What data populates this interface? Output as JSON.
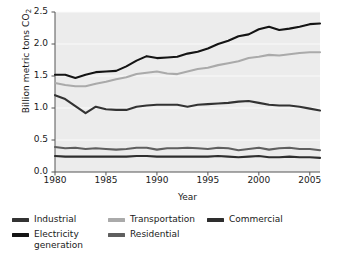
{
  "chart_data": {
    "type": "line",
    "title": "",
    "xlabel": "Year",
    "ylabel": "Billion metric tons CO",
    "ylabel_sub": "2",
    "xlim": [
      1980,
      2006
    ],
    "ylim": [
      0.0,
      2.5
    ],
    "xticks": [
      1980,
      1985,
      1990,
      1995,
      2000,
      2005
    ],
    "yticks": [
      "0.0",
      "0.5",
      "1.0",
      "1.5",
      "2.0",
      "2.5"
    ],
    "grid": "horizontal-faint",
    "legend_position": "below-plot",
    "plot_background": "#ececec",
    "x": [
      1980,
      1981,
      1982,
      1983,
      1984,
      1985,
      1986,
      1987,
      1988,
      1989,
      1990,
      1991,
      1992,
      1993,
      1994,
      1995,
      1996,
      1997,
      1998,
      1999,
      2000,
      2001,
      2002,
      2003,
      2004,
      2005,
      2006
    ],
    "series": [
      {
        "name": "Electricity generation",
        "color": "#141414",
        "values": [
          1.52,
          1.52,
          1.47,
          1.52,
          1.56,
          1.57,
          1.58,
          1.65,
          1.74,
          1.81,
          1.78,
          1.79,
          1.8,
          1.85,
          1.88,
          1.93,
          2.0,
          2.05,
          2.12,
          2.15,
          2.23,
          2.27,
          2.22,
          2.24,
          2.27,
          2.31,
          2.32
        ]
      },
      {
        "name": "Transportation",
        "color": "#aaaaaa",
        "values": [
          1.39,
          1.36,
          1.34,
          1.34,
          1.38,
          1.41,
          1.45,
          1.48,
          1.53,
          1.55,
          1.57,
          1.54,
          1.53,
          1.57,
          1.61,
          1.63,
          1.67,
          1.7,
          1.73,
          1.78,
          1.8,
          1.83,
          1.82,
          1.84,
          1.86,
          1.87,
          1.87
        ]
      },
      {
        "name": "Industrial",
        "color": "#333333",
        "values": [
          1.2,
          1.14,
          1.03,
          0.92,
          1.02,
          0.98,
          0.97,
          0.97,
          1.02,
          1.04,
          1.05,
          1.05,
          1.05,
          1.02,
          1.05,
          1.06,
          1.07,
          1.08,
          1.1,
          1.11,
          1.08,
          1.05,
          1.04,
          1.04,
          1.02,
          0.99,
          0.96
        ]
      },
      {
        "name": "Residential",
        "color": "#5f5f5f",
        "values": [
          0.39,
          0.37,
          0.38,
          0.36,
          0.37,
          0.36,
          0.35,
          0.36,
          0.38,
          0.38,
          0.35,
          0.37,
          0.37,
          0.38,
          0.37,
          0.36,
          0.38,
          0.37,
          0.34,
          0.36,
          0.38,
          0.35,
          0.37,
          0.38,
          0.36,
          0.36,
          0.34
        ]
      },
      {
        "name": "Commercial",
        "color": "#2e2e2e",
        "values": [
          0.25,
          0.24,
          0.24,
          0.24,
          0.24,
          0.24,
          0.24,
          0.24,
          0.25,
          0.25,
          0.24,
          0.24,
          0.24,
          0.24,
          0.24,
          0.24,
          0.25,
          0.24,
          0.23,
          0.24,
          0.25,
          0.23,
          0.23,
          0.24,
          0.23,
          0.23,
          0.22
        ]
      }
    ]
  },
  "legend": {
    "entries": [
      {
        "label": "Industrial",
        "color": "#333333"
      },
      {
        "label": "Electricity\ngeneration",
        "color": "#141414"
      },
      {
        "label": "Transportation",
        "color": "#aaaaaa"
      },
      {
        "label": "Residential",
        "color": "#5f5f5f"
      },
      {
        "label": "Commercial",
        "color": "#2e2e2e"
      }
    ]
  }
}
